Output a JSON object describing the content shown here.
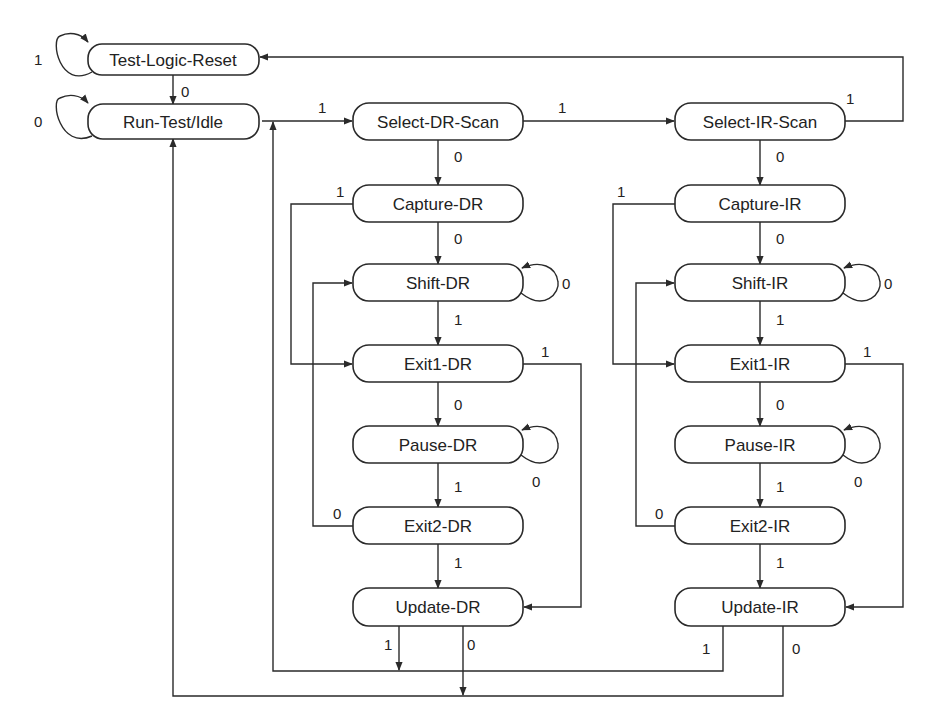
{
  "diagram": {
    "states": {
      "tlr": "Test-Logic-Reset",
      "rti": "Run-Test/Idle",
      "sdr": "Select-DR-Scan",
      "sir": "Select-IR-Scan",
      "cdr": "Capture-DR",
      "shdr": "Shift-DR",
      "e1dr": "Exit1-DR",
      "pdr": "Pause-DR",
      "e2dr": "Exit2-DR",
      "udr": "Update-DR",
      "cir": "Capture-IR",
      "shir": "Shift-IR",
      "e1ir": "Exit1-IR",
      "pir": "Pause-IR",
      "e2ir": "Exit2-IR",
      "uir": "Update-IR"
    },
    "labels": {
      "tlr_self": "1",
      "tlr_rti": "0",
      "rti_self": "0",
      "rti_sdr": "1",
      "sdr_sir": "1",
      "sir_tlr": "1",
      "sdr_cdr": "0",
      "sir_cir": "0",
      "cdr_e1dr": "1",
      "cdr_shdr": "0",
      "shdr_self": "0",
      "shdr_e1dr": "1",
      "e1dr_udr": "1",
      "e1dr_pdr": "0",
      "pdr_self": "0",
      "pdr_e2dr": "1",
      "e2dr_shdr": "0",
      "e2dr_udr": "1",
      "udr_sdr": "1",
      "udr_rti": "0",
      "cir_e1ir": "1",
      "cir_shir": "0",
      "shir_self": "0",
      "shir_e1ir": "1",
      "e1ir_uir": "1",
      "e1ir_pir": "0",
      "pir_self": "0",
      "pir_e2ir": "1",
      "e2ir_shir": "0",
      "e2ir_uir": "1",
      "uir_sdr": "1",
      "uir_rti": "0"
    }
  }
}
